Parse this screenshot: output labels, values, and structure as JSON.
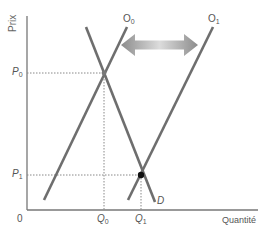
{
  "diagram": {
    "type": "supply-demand",
    "axes": {
      "y_label": "Prix",
      "x_label": "Quantité",
      "origin_label": "0"
    },
    "curves": [
      {
        "id": "supply-0",
        "label": "O",
        "subscript": "0",
        "from": [
          44,
          200
        ],
        "to": [
          127,
          27
        ]
      },
      {
        "id": "supply-1",
        "label": "O",
        "subscript": "1",
        "from": [
          128,
          200
        ],
        "to": [
          213,
          27
        ]
      },
      {
        "id": "demand",
        "label": "D",
        "subscript": "",
        "from": [
          86,
          27
        ],
        "to": [
          155,
          202
        ]
      }
    ],
    "price_ticks": [
      {
        "label": "P",
        "subscript": "0",
        "y": 73
      },
      {
        "label": "P",
        "subscript": "1",
        "y": 175
      }
    ],
    "quantity_ticks": [
      {
        "label": "Q",
        "subscript": "0",
        "x": 104
      },
      {
        "label": "Q",
        "subscript": "1",
        "x": 141
      }
    ],
    "equilibria": [
      {
        "id": "E0",
        "x": 104,
        "y": 73,
        "style": "hollow"
      },
      {
        "id": "E1",
        "x": 141,
        "y": 175,
        "style": "filled"
      }
    ],
    "shift_arrow": {
      "direction": "both",
      "from_x": 121,
      "to_x": 198,
      "y": 45
    },
    "colors": {
      "curve": "#6e6e6e",
      "axis": "#777777",
      "dotted": "#888888",
      "point": "#111111",
      "arrow_dark": "#8c8c8c",
      "arrow_light": "#d8d8d8",
      "text": "#555555"
    }
  }
}
